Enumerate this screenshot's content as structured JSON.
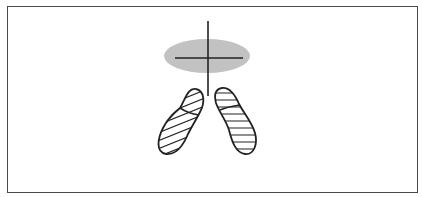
{
  "figure": {
    "type": "balance-stance-diagram",
    "elements": [
      {
        "id": "center-of-pressure-ellipse",
        "kind": "shaded-ellipse"
      },
      {
        "id": "crosshair",
        "kind": "cross-lines"
      },
      {
        "id": "left-foot",
        "kind": "hatched-footprint",
        "hatch": "diagonal"
      },
      {
        "id": "right-foot",
        "kind": "hatched-footprint",
        "hatch": "horizontal"
      }
    ],
    "colors": {
      "frame": "#4a4a4a",
      "ellipse_fill": "#c4c4c4",
      "line": "#222222",
      "background": "#ffffff"
    }
  }
}
